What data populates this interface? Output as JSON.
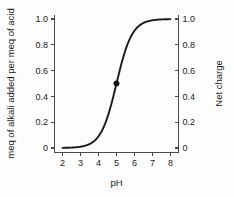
{
  "chart_data": {
    "type": "line",
    "title": "",
    "xlabel": "pH",
    "ylabel": "meq of alkali added per meq of acid",
    "y2label": "Net charge",
    "xlim": [
      1.55,
      8.45
    ],
    "ylim": [
      -0.035,
      1.035
    ],
    "grid": false,
    "legend": "none",
    "xticks": [
      2,
      3,
      4,
      5,
      6,
      7,
      8
    ],
    "xticklabels": [
      "2",
      "3",
      "4",
      "5",
      "6",
      "7",
      "8"
    ],
    "yticks": [
      0,
      0.2,
      0.4,
      0.6,
      0.8,
      1.0
    ],
    "yticklabels": [
      "0",
      "0.2",
      "0.4",
      "0.6",
      "0.8",
      "1.0"
    ],
    "y2ticks": [
      0,
      0.2,
      0.4,
      0.6,
      0.8,
      1.0
    ],
    "y2ticklabels": [
      "0",
      "0.2",
      "0.4",
      "0.6",
      "0.8",
      "1.0"
    ],
    "series": [
      {
        "name": "titration-curve",
        "color": "#1a1a1a",
        "model": "logistic",
        "pKa": 5.0,
        "x": [
          2.0,
          2.2,
          2.4,
          2.6,
          2.8,
          3.0,
          3.2,
          3.4,
          3.6,
          3.8,
          4.0,
          4.2,
          4.4,
          4.6,
          4.8,
          5.0,
          5.2,
          5.4,
          5.6,
          5.8,
          6.0,
          6.2,
          6.4,
          6.6,
          6.8,
          7.0,
          7.2,
          7.4,
          7.6,
          7.8,
          8.0
        ],
        "values": [
          0.001,
          0.002,
          0.003,
          0.004,
          0.006,
          0.01,
          0.016,
          0.025,
          0.039,
          0.06,
          0.091,
          0.137,
          0.2,
          0.285,
          0.387,
          0.5,
          0.613,
          0.715,
          0.8,
          0.863,
          0.909,
          0.94,
          0.961,
          0.975,
          0.984,
          0.99,
          0.994,
          0.996,
          0.997,
          0.998,
          0.999
        ]
      }
    ],
    "markers": [
      {
        "name": "pKa-midpoint",
        "x": 5.0,
        "y": 0.5,
        "shape": "filled-circle",
        "color": "#111111"
      }
    ]
  }
}
